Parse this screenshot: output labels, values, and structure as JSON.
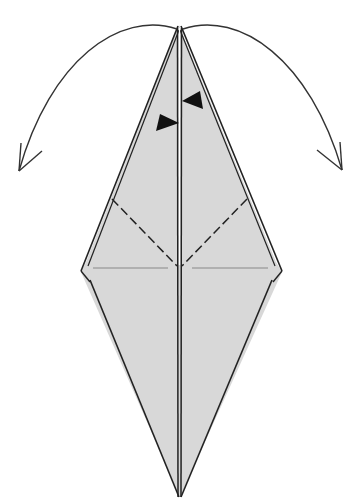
{
  "diagram": {
    "type": "origami-fold-step",
    "paper_color": "#d9d9d9",
    "line_color": "#222222",
    "faint_line_color": "#888888",
    "background": "#ffffff",
    "shape": "kite / bird-base variant, point at top and bottom",
    "symbols": [
      {
        "name": "left-fold-arrow",
        "description": "curved arrow from top point sweeping down-left"
      },
      {
        "name": "right-fold-arrow",
        "description": "curved arrow from top point sweeping down-right"
      },
      {
        "name": "push-arrow-right",
        "description": "black filled triangle pointing right toward center"
      },
      {
        "name": "push-arrow-left",
        "description": "black filled triangle pointing left toward center"
      },
      {
        "name": "valley-fold-left",
        "description": "dashed valley fold line on left flap"
      },
      {
        "name": "valley-fold-right",
        "description": "dashed valley fold line on right flap"
      }
    ]
  }
}
